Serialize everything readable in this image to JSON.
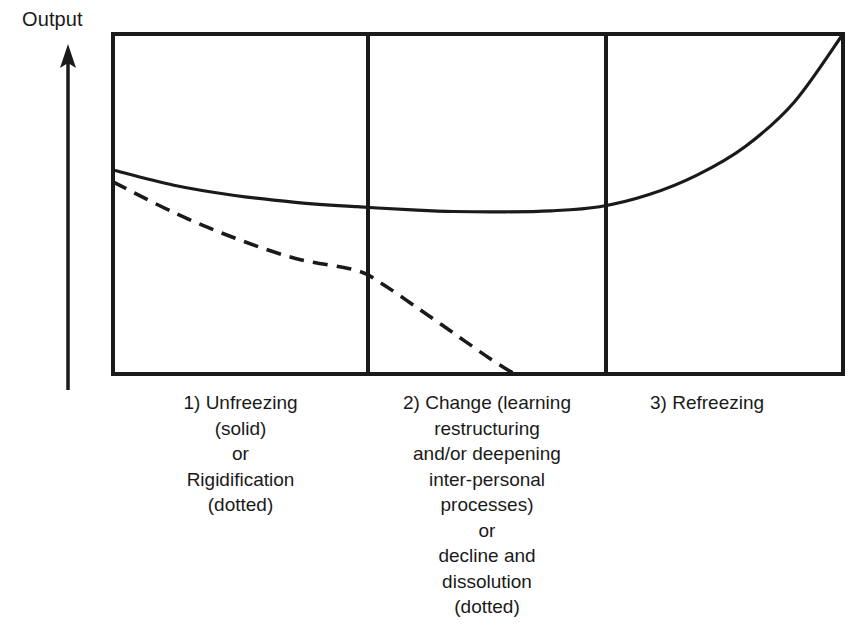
{
  "figure": {
    "axis_label": "Output",
    "axis_arrow": "up-arrow-icon",
    "background_color": "#ffffff",
    "line_color": "#1a1a1a"
  },
  "chart_data": {
    "type": "line",
    "title": "",
    "subtitle": "",
    "xlabel": "",
    "ylabel": "Output",
    "grid": false,
    "legend_position": "none",
    "annotations": [
      "1) Unfreezing (solid) or Rigidification (dotted)",
      "2) Change (learning restructuring and/or deepening inter-personal processes) or decline and dissolution (dotted)",
      "3) Refreezing"
    ],
    "phase_boundaries_px": [
      113,
      368,
      606,
      843
    ],
    "frame_px": {
      "left": 113,
      "top": 34,
      "right": 843,
      "bottom": 374
    },
    "xlim": [
      0,
      3
    ],
    "ylim": [
      0,
      1
    ],
    "series": [
      {
        "name": "solid",
        "style": "solid",
        "description": "Output dips slightly during unfreezing and change, then rises steeply through refreezing to a new high",
        "x": [
          0.0,
          0.25,
          0.5,
          0.75,
          1.0,
          1.25,
          1.4,
          1.6,
          1.8,
          2.0,
          2.2,
          2.4,
          2.6,
          2.8,
          3.0
        ],
        "y": [
          0.6,
          0.555,
          0.525,
          0.505,
          0.492,
          0.482,
          0.478,
          0.477,
          0.48,
          0.492,
          0.527,
          0.585,
          0.67,
          0.8,
          1.0
        ]
      },
      {
        "name": "dotted",
        "style": "dashed",
        "description": "Rigidification path declining steadily, then falling to zero during the change phase",
        "x": [
          0.0,
          0.25,
          0.5,
          0.75,
          1.0,
          1.1,
          1.25,
          1.4,
          1.55,
          1.65
        ],
        "y": [
          0.565,
          0.475,
          0.4,
          0.34,
          0.305,
          0.268,
          0.195,
          0.12,
          0.045,
          0.0
        ]
      }
    ]
  },
  "captions": {
    "column_1": "1) Unfreezing\n(solid)\nor\nRigidification\n(dotted)",
    "column_2": "2) Change (learning\nrestructuring\nand/or deepening\ninter-personal\nprocesses)\nor\ndecline and\ndissolution\n(dotted)",
    "column_3": "3) Refreezing"
  }
}
